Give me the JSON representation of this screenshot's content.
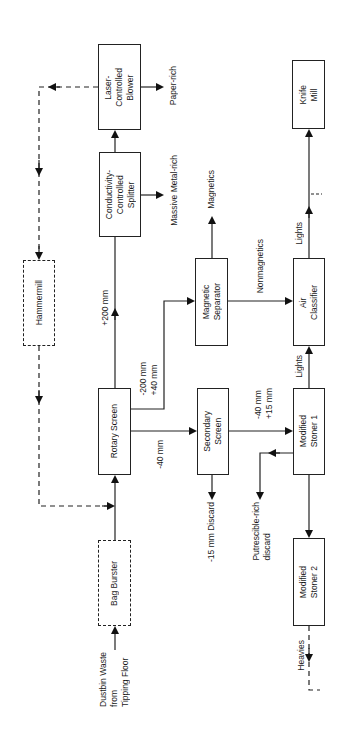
{
  "diagram": {
    "orientation": "rotated-90-ccw",
    "nodes": {
      "bag_burster": {
        "label": "Bag Burster",
        "style": "dashed"
      },
      "rotary_screen": {
        "label": "Rotary Screen",
        "style": "solid"
      },
      "hammermill": {
        "label": "Hammermill",
        "style": "dashed"
      },
      "conductivity_splitter": {
        "label": "Conductivity-\nControlled\nSplitter",
        "style": "solid"
      },
      "laser_blower": {
        "label": "Laser-\nControlled\nBlower",
        "style": "solid"
      },
      "secondary_screen": {
        "label": "Secondary\nScreen",
        "style": "solid"
      },
      "magnetic_separator": {
        "label": "Magnetic\nSeparator",
        "style": "solid"
      },
      "air_classifier": {
        "label": "Air\nClassifier",
        "style": "solid"
      },
      "knife_mill": {
        "label": "Knife\nMill",
        "style": "solid"
      },
      "modified_stoner_1": {
        "label": "Modified\nStoner 1",
        "style": "solid"
      },
      "modified_stoner_2": {
        "label": "Modified\nStoner 2",
        "style": "solid"
      }
    },
    "labels": {
      "input": "Dustbin Waste\nfrom\nTipping Floor",
      "plus200": "+200 mm",
      "minus200_plus40": "-200 mm\n+40 mm",
      "minus40": "-40 mm",
      "paper_rich": "Paper-rich",
      "massive_metal_rich": "Massive Metal-rich",
      "magnetics": "Magnetics",
      "nonmagnetics": "Nonmagnetics",
      "lights_air": "Lights",
      "lights_stoner": "Lights",
      "minus40_plus15": "-40 mm\n+15 mm",
      "discard_15": "-15 mm Discard",
      "putrescible": "Putrescible-rich\ndiscard",
      "heavies": "Heavies"
    },
    "edges": [
      {
        "from": "input",
        "to": "bag_burster"
      },
      {
        "from": "bag_burster",
        "to": "rotary_screen"
      },
      {
        "from": "rotary_screen",
        "to": "conductivity_splitter",
        "label": "+200 mm"
      },
      {
        "from": "rotary_screen",
        "to": "magnetic_separator",
        "label": "-200 mm +40 mm"
      },
      {
        "from": "rotary_screen",
        "to": "secondary_screen",
        "label": "-40 mm"
      },
      {
        "from": "conductivity_splitter",
        "to": "laser_blower"
      },
      {
        "from": "conductivity_splitter",
        "to": "output",
        "label": "Massive Metal-rich"
      },
      {
        "from": "laser_blower",
        "to": "output",
        "label": "Paper-rich"
      },
      {
        "from": "laser_blower",
        "to": "hammermill",
        "style": "dashed"
      },
      {
        "from": "hammermill",
        "to": "rotary_screen",
        "style": "dashed"
      },
      {
        "from": "magnetic_separator",
        "to": "output",
        "label": "Magnetics"
      },
      {
        "from": "magnetic_separator",
        "to": "air_classifier",
        "label": "Nonmagnetics"
      },
      {
        "from": "air_classifier",
        "to": "knife_mill",
        "label": "Lights"
      },
      {
        "from": "secondary_screen",
        "to": "modified_stoner_1",
        "label": "-40 mm +15 mm"
      },
      {
        "from": "secondary_screen",
        "to": "output",
        "label": "-15 mm Discard"
      },
      {
        "from": "modified_stoner_1",
        "to": "air_classifier",
        "label": "Lights"
      },
      {
        "from": "modified_stoner_1",
        "to": "output",
        "label": "Putrescible-rich discard"
      },
      {
        "from": "modified_stoner_1",
        "to": "modified_stoner_2"
      },
      {
        "from": "modified_stoner_2",
        "to": "output",
        "label": "Heavies",
        "style": "dashed"
      }
    ]
  }
}
